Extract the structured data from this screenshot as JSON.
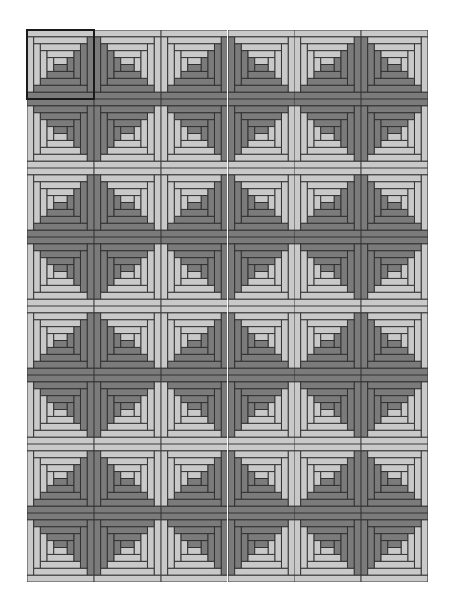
{
  "quilt": {
    "title": "Log cabin quilt pattern",
    "rows": 8,
    "cols": 6,
    "rings": 4,
    "colors": {
      "light": "#c9c9c9",
      "dark": "#7b7b7b",
      "line": "#2b2b2b",
      "selection": "#1a1a1a",
      "background": "#ffffff"
    },
    "selected_block": {
      "row": 0,
      "col": 0
    },
    "row_pattern": {
      "even_rows": [
        "BR",
        "BL",
        "BR",
        "BL",
        "BR",
        "BL"
      ],
      "odd_rows": [
        "TR",
        "TL",
        "TR",
        "TL",
        "TR",
        "TL"
      ]
    },
    "blocks": [
      [
        "BR",
        "BL",
        "BR",
        "BL",
        "BR",
        "BL"
      ],
      [
        "TR",
        "TL",
        "TR",
        "TL",
        "TR",
        "TL"
      ],
      [
        "BR",
        "BL",
        "BR",
        "BL",
        "BR",
        "BL"
      ],
      [
        "TR",
        "TL",
        "TR",
        "TL",
        "TR",
        "TL"
      ],
      [
        "BR",
        "BL",
        "BR",
        "BL",
        "BR",
        "BL"
      ],
      [
        "TR",
        "TL",
        "TR",
        "TL",
        "TR",
        "TL"
      ],
      [
        "BR",
        "BL",
        "BR",
        "BL",
        "BR",
        "BL"
      ],
      [
        "TR",
        "TL",
        "TR",
        "TL",
        "TR",
        "TL"
      ]
    ]
  }
}
